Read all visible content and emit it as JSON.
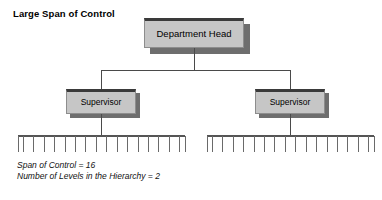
{
  "title": "Large Span of Control",
  "nodes": {
    "department_head": "Department Head",
    "supervisor_left": "Supervisor",
    "supervisor_right": "Supervisor"
  },
  "captions": {
    "span_of_control": "Span of Control = 16",
    "levels": "Number of Levels in the Hierarchy = 2"
  },
  "chart_data": {
    "type": "diagram",
    "diagram_type": "organizational-hierarchy-tree",
    "title": "Large Span of Control",
    "levels": 2,
    "span_of_control": 16,
    "root": "Department Head",
    "tier2": [
      "Supervisor",
      "Supervisor"
    ],
    "subordinates_per_supervisor": 16,
    "left_comb_teeth": 16,
    "right_comb_teeth": 16,
    "colors": {
      "box_fill": "#c6c6c6",
      "box_top_border": "#3a3a3a",
      "box_border": "#8d8d8d",
      "box_shadow": "#6e6e6e",
      "line": "#4a4a4a",
      "text": "#000000",
      "background": "#ffffff"
    },
    "annotations": [
      "Span of Control = 16",
      "Number of Levels in the Hierarchy = 2"
    ]
  },
  "geometry": {
    "left_comb": {
      "x_start": 18,
      "x_end": 185,
      "bar_y": 136,
      "tooth_bottom": 152,
      "teeth": 16
    },
    "right_comb": {
      "x_start": 207,
      "x_end": 374,
      "bar_y": 136,
      "tooth_bottom": 152,
      "teeth": 16
    }
  }
}
